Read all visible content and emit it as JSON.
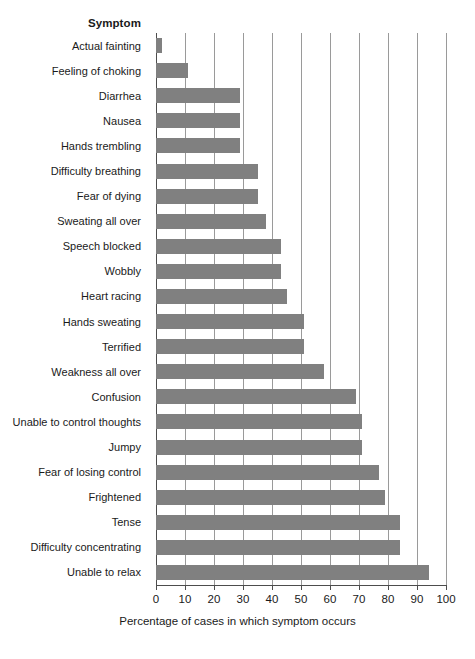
{
  "chart_data": {
    "type": "bar",
    "orientation": "horizontal",
    "title": "",
    "xlabel": "Percentage of cases in which symptom occurs",
    "ylabel": "Symptom",
    "xlim": [
      0,
      100
    ],
    "xticks": [
      0,
      10,
      20,
      30,
      40,
      50,
      60,
      70,
      80,
      90,
      100
    ],
    "xtick_labels": [
      "0",
      "10",
      "20",
      "30",
      "40",
      "50",
      "60",
      "70",
      "80",
      "90",
      "100"
    ],
    "grid": "vertical",
    "legend": "none",
    "bar_color": "#808080",
    "axis_color": "#4d4d4d",
    "gridline_color": "#9a9a9a",
    "categories": [
      "Actual fainting",
      "Feeling of choking",
      "Diarrhea",
      "Nausea",
      "Hands trembling",
      "Difficulty breathing",
      "Fear of dying",
      "Sweating all over",
      "Speech blocked",
      "Wobbly",
      "Heart racing",
      "Hands sweating",
      "Terrified",
      "Weakness all over",
      "Confusion",
      "Unable to control thoughts",
      "Jumpy",
      "Fear of losing control",
      "Frightened",
      "Tense",
      "Difficulty concentrating",
      "Unable to relax"
    ],
    "values": [
      2,
      11,
      29,
      29,
      29,
      35,
      35,
      38,
      43,
      43,
      45,
      51,
      51,
      58,
      69,
      71,
      71,
      77,
      79,
      84,
      84,
      94
    ]
  }
}
